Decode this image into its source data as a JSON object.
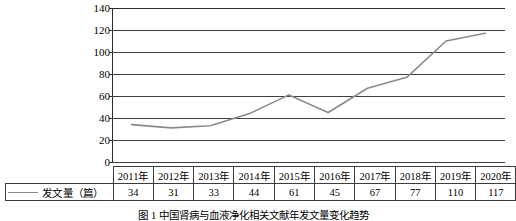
{
  "chart_data": {
    "type": "line",
    "title": "",
    "xlabel": "",
    "ylabel": "",
    "ylim": [
      0,
      140
    ],
    "ytick_step": 20,
    "yticks": [
      "140",
      "120",
      "100",
      "80",
      "60",
      "40",
      "20",
      "0"
    ],
    "grid": true,
    "legend_position": "table-left",
    "line_color": "#8a8a8a",
    "categories": [
      "2011年",
      "2012年",
      "2013年",
      "2014年",
      "2015年",
      "2016年",
      "2017年",
      "2018年",
      "2019年",
      "2020年"
    ],
    "series": [
      {
        "name": "发文量（篇）",
        "values": [
          34,
          31,
          33,
          44,
          61,
          45,
          67,
          77,
          110,
          117
        ]
      }
    ]
  },
  "table": {
    "legend_label": "发文量（篇）",
    "header": [
      "2011年",
      "2012年",
      "2013年",
      "2014年",
      "2015年",
      "2016年",
      "2017年",
      "2018年",
      "2019年",
      "2020年"
    ],
    "values": [
      "34",
      "31",
      "33",
      "44",
      "61",
      "45",
      "67",
      "77",
      "110",
      "117"
    ]
  },
  "caption": {
    "text": "图 1    中国肾病与血液净化相关文献年发文量变化趋势"
  }
}
